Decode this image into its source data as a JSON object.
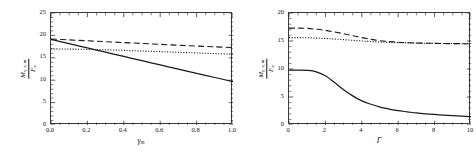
{
  "figure": {
    "background": "#ffffff",
    "line_color": "#1a1a1a",
    "panels": [
      "left",
      "right"
    ]
  },
  "chart_data": [
    {
      "type": "line",
      "panel": "left",
      "title": "",
      "xlabel": "γₘ",
      "xlabel_base": "γ",
      "xlabel_sub": "m",
      "ylabel": "M / F",
      "ylabel_num": "M",
      "ylabel_num_sub": "x, a, m",
      "ylabel_den": "F",
      "ylabel_den_sub": "a",
      "xlim": [
        0.0,
        1.0
      ],
      "ylim": [
        0,
        25
      ],
      "xticks": [
        "0.0",
        "0.2",
        "0.4",
        "0.6",
        "0.8",
        "1.0"
      ],
      "xtick_values": [
        0.0,
        0.2,
        0.4,
        0.6,
        0.8,
        1.0
      ],
      "yticks": [
        "0",
        "5",
        "10",
        "15",
        "20",
        "25"
      ],
      "ytick_values": [
        0,
        5,
        10,
        15,
        20,
        25
      ],
      "grid": false,
      "legend": "none",
      "series": [
        {
          "name": "solid",
          "style": "solid",
          "x": [
            0.0,
            0.1,
            0.2,
            0.3,
            0.4,
            0.5,
            0.6,
            0.7,
            0.8,
            0.9,
            1.0
          ],
          "values": [
            19.1,
            18.15,
            17.2,
            16.25,
            15.3,
            14.35,
            13.4,
            12.45,
            11.5,
            10.6,
            9.7
          ]
        },
        {
          "name": "dashed",
          "style": "dashed",
          "x": [
            0.0,
            0.1,
            0.2,
            0.3,
            0.4,
            0.5,
            0.6,
            0.7,
            0.8,
            0.9,
            1.0
          ],
          "values": [
            19.2,
            19.0,
            18.8,
            18.6,
            18.4,
            18.2,
            18.0,
            17.8,
            17.62,
            17.45,
            17.3
          ]
        },
        {
          "name": "dotted",
          "style": "dotted",
          "x": [
            0.0,
            0.1,
            0.2,
            0.3,
            0.4,
            0.5,
            0.6,
            0.7,
            0.8,
            0.9,
            1.0
          ],
          "values": [
            17.0,
            16.95,
            16.88,
            16.78,
            16.66,
            16.52,
            16.38,
            16.22,
            16.08,
            15.94,
            15.8
          ]
        }
      ]
    },
    {
      "type": "line",
      "panel": "right",
      "title": "",
      "xlabel": "Γ",
      "xlabel_base": "Γ",
      "xlabel_sub": "",
      "ylabel": "M / F",
      "ylabel_num": "M",
      "ylabel_num_sub": "y, a, m",
      "ylabel_den": "F",
      "ylabel_den_sub": "a",
      "xlim": [
        0,
        10
      ],
      "ylim": [
        0,
        20
      ],
      "xticks": [
        "0",
        "2",
        "4",
        "6",
        "8",
        "10"
      ],
      "xtick_values": [
        0,
        2,
        4,
        6,
        8,
        10
      ],
      "yticks": [
        "0",
        "5",
        "10",
        "15",
        "20"
      ],
      "ytick_values": [
        0,
        5,
        10,
        15,
        20
      ],
      "grid": false,
      "legend": "none",
      "series": [
        {
          "name": "solid",
          "style": "solid",
          "x": [
            0,
            0.5,
            1.0,
            1.5,
            2.0,
            2.5,
            3.0,
            3.5,
            4.0,
            4.5,
            5.0,
            5.5,
            6.0,
            6.5,
            7.0,
            7.5,
            8.0,
            8.5,
            9.0,
            9.5,
            10.0
          ],
          "values": [
            9.8,
            9.8,
            9.75,
            9.5,
            8.8,
            7.6,
            6.3,
            5.2,
            4.3,
            3.7,
            3.2,
            2.85,
            2.55,
            2.35,
            2.15,
            2.0,
            1.88,
            1.76,
            1.66,
            1.58,
            1.5
          ]
        },
        {
          "name": "dashed",
          "style": "dashed",
          "x": [
            0,
            0.5,
            1.0,
            1.5,
            2.0,
            2.5,
            3.0,
            3.5,
            4.0,
            4.5,
            5.0,
            5.5,
            6.0,
            6.5,
            7.0,
            7.5,
            8.0,
            8.5,
            9.0,
            9.5,
            10.0
          ],
          "values": [
            17.3,
            17.3,
            17.25,
            17.1,
            16.9,
            16.6,
            16.3,
            15.95,
            15.6,
            15.3,
            15.05,
            14.9,
            14.78,
            14.7,
            14.65,
            14.6,
            14.58,
            14.55,
            14.53,
            14.52,
            14.5
          ]
        },
        {
          "name": "dotted",
          "style": "dotted",
          "x": [
            0,
            0.5,
            1.0,
            1.5,
            2.0,
            2.5,
            3.0,
            3.5,
            4.0,
            4.5,
            5.0,
            5.5,
            6.0,
            6.5,
            7.0,
            7.5,
            8.0,
            8.5,
            9.0,
            9.5,
            10.0
          ],
          "values": [
            15.6,
            15.6,
            15.58,
            15.52,
            15.45,
            15.35,
            15.25,
            15.12,
            15.0,
            14.9,
            14.82,
            14.75,
            14.7,
            14.66,
            14.62,
            14.6,
            14.58,
            14.56,
            14.54,
            14.52,
            14.5
          ]
        }
      ]
    }
  ]
}
